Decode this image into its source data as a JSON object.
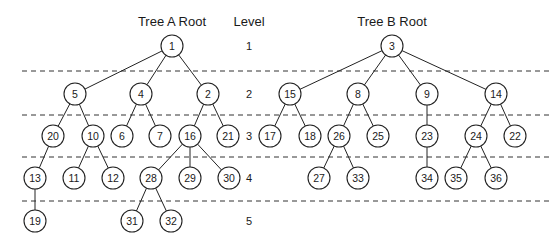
{
  "titles": {
    "tree_a": "Tree A Root",
    "level": "Level",
    "tree_b": "Tree B Root"
  },
  "levels": [
    "1",
    "2",
    "3",
    "4",
    "5"
  ],
  "tree_a": {
    "nodes": [
      {
        "id": "1",
        "x": 172,
        "y": 46
      },
      {
        "id": "5",
        "x": 75,
        "y": 94
      },
      {
        "id": "4",
        "x": 141,
        "y": 94
      },
      {
        "id": "2",
        "x": 208,
        "y": 94
      },
      {
        "id": "20",
        "x": 53,
        "y": 136
      },
      {
        "id": "10",
        "x": 93,
        "y": 136
      },
      {
        "id": "6",
        "x": 122,
        "y": 136
      },
      {
        "id": "7",
        "x": 160,
        "y": 136
      },
      {
        "id": "16",
        "x": 190,
        "y": 136
      },
      {
        "id": "21",
        "x": 228,
        "y": 136
      },
      {
        "id": "13",
        "x": 35,
        "y": 178
      },
      {
        "id": "11",
        "x": 74,
        "y": 178
      },
      {
        "id": "12",
        "x": 113,
        "y": 178
      },
      {
        "id": "28",
        "x": 151,
        "y": 178
      },
      {
        "id": "29",
        "x": 190,
        "y": 178
      },
      {
        "id": "30",
        "x": 229,
        "y": 178
      },
      {
        "id": "19",
        "x": 35,
        "y": 221
      },
      {
        "id": "31",
        "x": 132,
        "y": 221
      },
      {
        "id": "32",
        "x": 171,
        "y": 221
      }
    ],
    "edges": [
      [
        "1",
        "5"
      ],
      [
        "1",
        "4"
      ],
      [
        "1",
        "2"
      ],
      [
        "5",
        "20"
      ],
      [
        "5",
        "10"
      ],
      [
        "4",
        "6"
      ],
      [
        "4",
        "7"
      ],
      [
        "2",
        "16"
      ],
      [
        "2",
        "21"
      ],
      [
        "20",
        "13"
      ],
      [
        "10",
        "11"
      ],
      [
        "10",
        "12"
      ],
      [
        "16",
        "28"
      ],
      [
        "16",
        "29"
      ],
      [
        "16",
        "30"
      ],
      [
        "13",
        "19"
      ],
      [
        "28",
        "31"
      ],
      [
        "28",
        "32"
      ]
    ]
  },
  "tree_b": {
    "nodes": [
      {
        "id": "3",
        "x": 392,
        "y": 46
      },
      {
        "id": "15",
        "x": 290,
        "y": 94
      },
      {
        "id": "8",
        "x": 358,
        "y": 94
      },
      {
        "id": "9",
        "x": 427,
        "y": 94
      },
      {
        "id": "14",
        "x": 496,
        "y": 94
      },
      {
        "id": "17",
        "x": 270,
        "y": 136
      },
      {
        "id": "18",
        "x": 310,
        "y": 136
      },
      {
        "id": "26",
        "x": 339,
        "y": 136
      },
      {
        "id": "25",
        "x": 378,
        "y": 136
      },
      {
        "id": "23",
        "x": 427,
        "y": 136
      },
      {
        "id": "24",
        "x": 476,
        "y": 136
      },
      {
        "id": "22",
        "x": 515,
        "y": 136
      },
      {
        "id": "27",
        "x": 319,
        "y": 178
      },
      {
        "id": "33",
        "x": 358,
        "y": 178
      },
      {
        "id": "34",
        "x": 427,
        "y": 178
      },
      {
        "id": "35",
        "x": 456,
        "y": 178
      },
      {
        "id": "36",
        "x": 496,
        "y": 178
      }
    ],
    "edges": [
      [
        "3",
        "15"
      ],
      [
        "3",
        "8"
      ],
      [
        "3",
        "9"
      ],
      [
        "3",
        "14"
      ],
      [
        "15",
        "17"
      ],
      [
        "15",
        "18"
      ],
      [
        "8",
        "26"
      ],
      [
        "8",
        "25"
      ],
      [
        "9",
        "23"
      ],
      [
        "14",
        "24"
      ],
      [
        "14",
        "22"
      ],
      [
        "26",
        "27"
      ],
      [
        "26",
        "33"
      ],
      [
        "23",
        "34"
      ],
      [
        "24",
        "35"
      ],
      [
        "24",
        "36"
      ]
    ]
  }
}
